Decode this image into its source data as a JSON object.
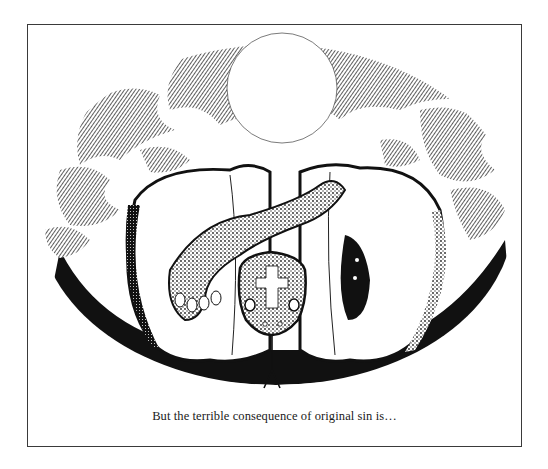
{
  "illustration": {
    "subject": "serpent-in-apple",
    "elements": [
      "moon",
      "tree-foliage",
      "split-apple",
      "serpent",
      "cross-on-serpent-head",
      "forked-tongue"
    ],
    "colors": {
      "ink": "#111111",
      "paper": "#ffffff",
      "frame": "#3a3a3a",
      "stipple": "#555555"
    }
  },
  "caption": {
    "text": "But the terrible consequence of original sin is…"
  }
}
